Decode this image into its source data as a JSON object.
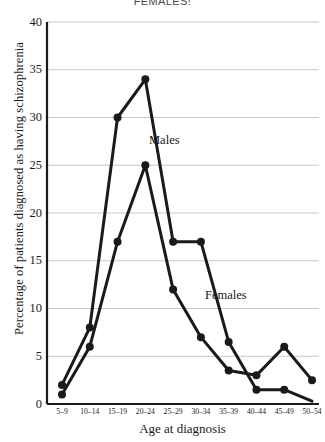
{
  "figure": {
    "top_caption": "FEMALES!",
    "series_labels": {
      "males": "Males",
      "females": "Females"
    }
  },
  "chart_data": {
    "type": "line",
    "title": "",
    "xlabel": "Age at diagnosis",
    "ylabel": "Percentage of patients diagnosed as having schizophrenia",
    "categories": [
      "5–9",
      "10–14",
      "15–19",
      "20–24",
      "25–29",
      "30–34",
      "35–39",
      "40–44",
      "45–49",
      "50–54"
    ],
    "series": [
      {
        "name": "Males",
        "values": [
          2,
          8,
          30,
          34,
          17,
          17,
          6.5,
          1.5,
          1.5,
          0.3
        ],
        "color": "#1a1a1a"
      },
      {
        "name": "Females",
        "values": [
          1,
          6,
          17,
          25,
          12,
          7,
          3.5,
          3,
          6,
          2.5
        ],
        "color": "#1a1a1a"
      }
    ],
    "ylim": [
      0,
      40
    ],
    "yticks": [
      0,
      5,
      10,
      15,
      20,
      25,
      30,
      35,
      40
    ],
    "ytick_labels": [
      "0",
      "5",
      "10",
      "15",
      "20",
      "25",
      "30",
      "35",
      "40"
    ],
    "grid": true,
    "grid_axis": "y",
    "grid_color": "#c8c8c8",
    "legend": "inline-annotations",
    "marker": "circle",
    "line_width": 3
  }
}
